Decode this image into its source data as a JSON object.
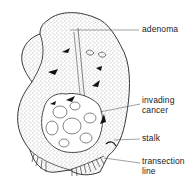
{
  "figure": {
    "labels": [
      {
        "id": "adenoma",
        "text": "adenoma"
      },
      {
        "id": "invading-cancer",
        "lines": [
          "invading",
          "cancer"
        ]
      },
      {
        "id": "stalk",
        "text": "stalk"
      },
      {
        "id": "transection-line",
        "lines": [
          "transection",
          "line"
        ]
      }
    ]
  },
  "colors": {
    "ink": "#222222",
    "stipple": "#555555",
    "background": "#ffffff"
  }
}
